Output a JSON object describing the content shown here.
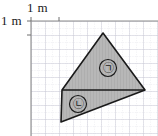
{
  "figure": {
    "type": "geometry-grid-diagram",
    "scale_labels": {
      "top": "1 m",
      "left": "1 m"
    },
    "grid": {
      "origin_x": 31,
      "origin_y": 21,
      "cell_size": 14,
      "major_color": "#c9c9d4",
      "minor_color": "#d9d9e2",
      "axis_color": "#7a7a7a",
      "cols": 10,
      "rows": 9
    },
    "shape": {
      "name": "shaded-quadrilateral",
      "fill_color": "#b7b7b7",
      "stroke_color": "#1a1a1a",
      "vertices": [
        {
          "x": 103,
          "y": 33
        },
        {
          "x": 145,
          "y": 90
        },
        {
          "x": 61,
          "y": 122
        },
        {
          "x": 62,
          "y": 90
        }
      ]
    },
    "divider": {
      "name": "divider-line",
      "from": {
        "x": 62,
        "y": 90
      },
      "to": {
        "x": 145,
        "y": 90
      }
    },
    "regions": [
      {
        "id": "region-a",
        "label": "㉠",
        "cx": 108,
        "cy": 68
      },
      {
        "id": "region-b",
        "label": "㉡",
        "cx": 78,
        "cy": 104
      }
    ]
  }
}
